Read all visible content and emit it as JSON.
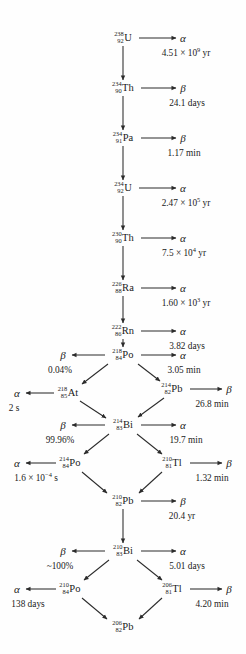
{
  "figure": {
    "line_color": "#2b2b2b",
    "text_color": "#1a1a1a",
    "background": "#fefefe"
  },
  "nuclides": [
    {
      "id": "U238",
      "a": "238",
      "z": "92",
      "sym": "U",
      "x": 123,
      "y": 38
    },
    {
      "id": "Th234",
      "a": "234",
      "z": "90",
      "sym": "Th",
      "x": 123,
      "y": 88
    },
    {
      "id": "Pa234",
      "a": "234",
      "z": "91",
      "sym": "Pa",
      "x": 123,
      "y": 138
    },
    {
      "id": "U234",
      "a": "234",
      "z": "92",
      "sym": "U",
      "x": 123,
      "y": 188
    },
    {
      "id": "Th230",
      "a": "230",
      "z": "90",
      "sym": "Th",
      "x": 123,
      "y": 238
    },
    {
      "id": "Ra226",
      "a": "226",
      "z": "88",
      "sym": "Ra",
      "x": 123,
      "y": 288
    },
    {
      "id": "Rn222",
      "a": "222",
      "z": "86",
      "sym": "Rn",
      "x": 123,
      "y": 331
    },
    {
      "id": "Po218",
      "a": "218",
      "z": "84",
      "sym": "Po",
      "x": 123,
      "y": 355
    },
    {
      "id": "At218",
      "a": "218",
      "z": "85",
      "sym": "At",
      "x": 68,
      "y": 393
    },
    {
      "id": "Pb214",
      "a": "214",
      "z": "82",
      "sym": "Pb",
      "x": 172,
      "y": 389
    },
    {
      "id": "Bi214",
      "a": "214",
      "z": "83",
      "sym": "Bi",
      "x": 123,
      "y": 425
    },
    {
      "id": "Po214",
      "a": "214",
      "z": "84",
      "sym": "Po",
      "x": 70,
      "y": 463
    },
    {
      "id": "Tl210",
      "a": "210",
      "z": "81",
      "sym": "Tl",
      "x": 172,
      "y": 463
    },
    {
      "id": "Pb210",
      "a": "210",
      "z": "82",
      "sym": "Pb",
      "x": 123,
      "y": 501
    },
    {
      "id": "Bi210",
      "a": "210",
      "z": "83",
      "sym": "Bi",
      "x": 123,
      "y": 551
    },
    {
      "id": "Po210",
      "a": "210",
      "z": "84",
      "sym": "Po",
      "x": 70,
      "y": 589
    },
    {
      "id": "Tl206",
      "a": "206",
      "z": "81",
      "sym": "Tl",
      "x": 172,
      "y": 589
    },
    {
      "id": "Pb206",
      "a": "206",
      "z": "82",
      "sym": "Pb",
      "x": 123,
      "y": 627
    }
  ],
  "decays": [
    {
      "mode": "α",
      "mode_x": 183,
      "mode_y": 38,
      "note": "4.51 × 10",
      "exp": "9",
      "note_suffix": " yr",
      "note_x": 186,
      "note_y": 54
    },
    {
      "mode": "β",
      "mode_x": 183,
      "mode_y": 88,
      "note": "24.1 days",
      "exp": "",
      "note_suffix": "",
      "note_x": 187,
      "note_y": 104
    },
    {
      "mode": "β",
      "mode_x": 183,
      "mode_y": 138,
      "note": "1.17 min",
      "exp": "",
      "note_suffix": "",
      "note_x": 184,
      "note_y": 154
    },
    {
      "mode": "α",
      "mode_x": 183,
      "mode_y": 188,
      "note": "2.47 × 10",
      "exp": "5",
      "note_suffix": " yr",
      "note_x": 186,
      "note_y": 204
    },
    {
      "mode": "α",
      "mode_x": 183,
      "mode_y": 238,
      "note": "7.5 × 10",
      "exp": "4",
      "note_suffix": " yr",
      "note_x": 184,
      "note_y": 254
    },
    {
      "mode": "α",
      "mode_x": 183,
      "mode_y": 288,
      "note": "1.60 × 10",
      "exp": "3",
      "note_suffix": " yr",
      "note_x": 186,
      "note_y": 304
    },
    {
      "mode": "α",
      "mode_x": 183,
      "mode_y": 331,
      "note": "3.82 days",
      "exp": "",
      "note_suffix": "",
      "note_x": 187,
      "note_y": 347
    },
    {
      "mode": "α",
      "mode_x": 183,
      "mode_y": 355,
      "note": "3.05 min",
      "exp": "",
      "note_suffix": "",
      "note_x": 184,
      "note_y": 371
    },
    {
      "mode": "β",
      "mode_x": 63,
      "mode_y": 355,
      "note": "0.04%",
      "exp": "",
      "note_suffix": "",
      "note_x": 60,
      "note_y": 371
    },
    {
      "mode": "α",
      "mode_x": 17,
      "mode_y": 393,
      "note": "2 s",
      "exp": "",
      "note_suffix": "",
      "note_x": 14,
      "note_y": 409
    },
    {
      "mode": "β",
      "mode_x": 229,
      "mode_y": 389,
      "note": "26.8 min",
      "exp": "",
      "note_suffix": "",
      "note_x": 212,
      "note_y": 405
    },
    {
      "mode": "α",
      "mode_x": 183,
      "mode_y": 425,
      "note": "19.7 min",
      "exp": "",
      "note_suffix": "",
      "note_x": 186,
      "note_y": 441
    },
    {
      "mode": "β",
      "mode_x": 63,
      "mode_y": 425,
      "note": "99.96%",
      "exp": "",
      "note_suffix": "",
      "note_x": 60,
      "note_y": 441
    },
    {
      "mode": "α",
      "mode_x": 17,
      "mode_y": 463,
      "note": "1.6 × 10",
      "exp": "−4",
      "note_suffix": " s",
      "note_x": 36,
      "note_y": 479
    },
    {
      "mode": "β",
      "mode_x": 229,
      "mode_y": 463,
      "note": "1.32 min",
      "exp": "",
      "note_suffix": "",
      "note_x": 212,
      "note_y": 479
    },
    {
      "mode": "β",
      "mode_x": 183,
      "mode_y": 501,
      "note": "20.4 yr",
      "exp": "",
      "note_suffix": "",
      "note_x": 182,
      "note_y": 517
    },
    {
      "mode": "α",
      "mode_x": 183,
      "mode_y": 551,
      "note": "5.01 days",
      "exp": "",
      "note_suffix": "",
      "note_x": 187,
      "note_y": 567
    },
    {
      "mode": "β",
      "mode_x": 63,
      "mode_y": 551,
      "note": "~100%",
      "exp": "",
      "note_suffix": "",
      "note_x": 60,
      "note_y": 567
    },
    {
      "mode": "α",
      "mode_x": 17,
      "mode_y": 589,
      "note": "138 days",
      "exp": "",
      "note_suffix": "",
      "note_x": 28,
      "note_y": 605
    },
    {
      "mode": "β",
      "mode_x": 229,
      "mode_y": 589,
      "note": "4.20 min",
      "exp": "",
      "note_suffix": "",
      "note_x": 212,
      "note_y": 605
    }
  ],
  "edges": [
    {
      "x1": 123,
      "y1": 46,
      "x2": 123,
      "y2": 80,
      "arrow": true
    },
    {
      "x1": 123,
      "y1": 96,
      "x2": 123,
      "y2": 130,
      "arrow": true
    },
    {
      "x1": 123,
      "y1": 146,
      "x2": 123,
      "y2": 180,
      "arrow": true
    },
    {
      "x1": 123,
      "y1": 196,
      "x2": 123,
      "y2": 230,
      "arrow": true
    },
    {
      "x1": 123,
      "y1": 246,
      "x2": 123,
      "y2": 280,
      "arrow": true
    },
    {
      "x1": 123,
      "y1": 296,
      "x2": 123,
      "y2": 323,
      "arrow": true
    },
    {
      "x1": 123,
      "y1": 339,
      "x2": 123,
      "y2": 347,
      "arrow": true
    },
    {
      "x1": 139,
      "y1": 38,
      "x2": 176,
      "y2": 38,
      "arrow": true
    },
    {
      "x1": 141,
      "y1": 88,
      "x2": 176,
      "y2": 88,
      "arrow": true
    },
    {
      "x1": 141,
      "y1": 138,
      "x2": 176,
      "y2": 138,
      "arrow": true
    },
    {
      "x1": 139,
      "y1": 188,
      "x2": 176,
      "y2": 188,
      "arrow": true
    },
    {
      "x1": 141,
      "y1": 238,
      "x2": 176,
      "y2": 238,
      "arrow": true
    },
    {
      "x1": 141,
      "y1": 288,
      "x2": 176,
      "y2": 288,
      "arrow": true
    },
    {
      "x1": 141,
      "y1": 331,
      "x2": 176,
      "y2": 331,
      "arrow": true
    },
    {
      "x1": 141,
      "y1": 355,
      "x2": 176,
      "y2": 355,
      "arrow": true
    },
    {
      "x1": 105,
      "y1": 355,
      "x2": 72,
      "y2": 355,
      "arrow": true
    },
    {
      "x1": 108,
      "y1": 364,
      "x2": 82,
      "y2": 384,
      "arrow": true
    },
    {
      "x1": 138,
      "y1": 364,
      "x2": 160,
      "y2": 381,
      "arrow": true
    },
    {
      "x1": 54,
      "y1": 393,
      "x2": 26,
      "y2": 393,
      "arrow": true
    },
    {
      "x1": 190,
      "y1": 389,
      "x2": 222,
      "y2": 389,
      "arrow": true
    },
    {
      "x1": 80,
      "y1": 401,
      "x2": 106,
      "y2": 418,
      "arrow": true
    },
    {
      "x1": 164,
      "y1": 398,
      "x2": 138,
      "y2": 417,
      "arrow": true
    },
    {
      "x1": 141,
      "y1": 425,
      "x2": 176,
      "y2": 425,
      "arrow": true
    },
    {
      "x1": 105,
      "y1": 425,
      "x2": 72,
      "y2": 425,
      "arrow": true
    },
    {
      "x1": 109,
      "y1": 434,
      "x2": 84,
      "y2": 454,
      "arrow": true
    },
    {
      "x1": 137,
      "y1": 434,
      "x2": 162,
      "y2": 454,
      "arrow": true
    },
    {
      "x1": 56,
      "y1": 463,
      "x2": 26,
      "y2": 463,
      "arrow": true
    },
    {
      "x1": 190,
      "y1": 463,
      "x2": 222,
      "y2": 463,
      "arrow": true
    },
    {
      "x1": 82,
      "y1": 472,
      "x2": 107,
      "y2": 493,
      "arrow": true
    },
    {
      "x1": 162,
      "y1": 472,
      "x2": 139,
      "y2": 493,
      "arrow": true
    },
    {
      "x1": 141,
      "y1": 501,
      "x2": 176,
      "y2": 501,
      "arrow": true
    },
    {
      "x1": 123,
      "y1": 509,
      "x2": 123,
      "y2": 543,
      "arrow": true
    },
    {
      "x1": 141,
      "y1": 551,
      "x2": 176,
      "y2": 551,
      "arrow": true
    },
    {
      "x1": 105,
      "y1": 551,
      "x2": 72,
      "y2": 551,
      "arrow": true
    },
    {
      "x1": 109,
      "y1": 560,
      "x2": 84,
      "y2": 580,
      "arrow": true
    },
    {
      "x1": 137,
      "y1": 560,
      "x2": 162,
      "y2": 580,
      "arrow": true
    },
    {
      "x1": 56,
      "y1": 589,
      "x2": 26,
      "y2": 589,
      "arrow": true
    },
    {
      "x1": 190,
      "y1": 589,
      "x2": 222,
      "y2": 589,
      "arrow": true
    },
    {
      "x1": 82,
      "y1": 598,
      "x2": 107,
      "y2": 619,
      "arrow": true
    },
    {
      "x1": 162,
      "y1": 598,
      "x2": 139,
      "y2": 619,
      "arrow": true
    }
  ]
}
